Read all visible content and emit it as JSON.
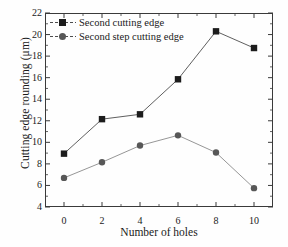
{
  "chart_data": {
    "type": "line",
    "title": "",
    "xlabel": "Number of holes",
    "ylabel": "Cutting edge rounding (μm)",
    "x": [
      0,
      2,
      4,
      6,
      8,
      10
    ],
    "xlim": [
      -1,
      11
    ],
    "ylim": [
      4,
      22
    ],
    "xticks": [
      "0",
      "2",
      "4",
      "6",
      "8",
      "10"
    ],
    "yticks": [
      "4",
      "6",
      "8",
      "10",
      "12",
      "14",
      "16",
      "18",
      "20",
      "22"
    ],
    "grid": false,
    "legend_position": "top-left",
    "series": [
      {
        "name": "Second cutting edge",
        "marker": "square",
        "color": "#1c1c1c",
        "line_color": "#4d4d4d",
        "values": [
          8.95,
          12.15,
          12.6,
          15.85,
          20.3,
          18.75
        ]
      },
      {
        "name": "Second step cutting edge",
        "marker": "circle",
        "color": "#575757",
        "line_color": "#8a8a8a",
        "values": [
          6.7,
          8.15,
          9.7,
          10.65,
          9.05,
          5.75
        ]
      }
    ]
  },
  "legend": {
    "items": [
      {
        "label": "Second cutting edge"
      },
      {
        "label": "Second step cutting edge"
      }
    ]
  },
  "axes": {
    "x_label": "Number of holes",
    "y_label": "Cutting edge rounding (μm)"
  }
}
